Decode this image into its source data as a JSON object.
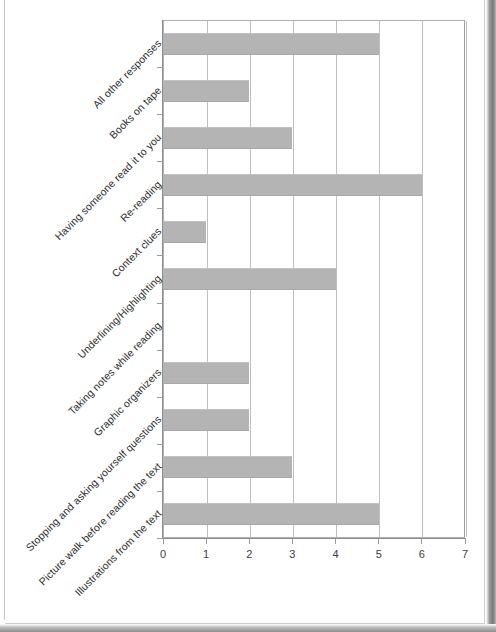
{
  "chart_data": {
    "type": "bar",
    "orientation": "horizontal",
    "title": "",
    "subtitle": "",
    "xlabel": "",
    "ylabel": "",
    "xlim": [
      0,
      7
    ],
    "ylim": null,
    "grid": true,
    "legend": null,
    "legend_position": "none",
    "xticks": [
      "0",
      "1",
      "2",
      "3",
      "4",
      "5",
      "6",
      "7"
    ],
    "categories": [
      "All other responses",
      "Books on tape",
      "Having someone read it to you",
      "Re-reading",
      "Context clues",
      "Underlining/Highlighting",
      "Taking notes while reading",
      "Graphic organizers",
      "Stopping and asking yourself questions",
      "Picture walk before reading the text",
      "Illustrations from the text"
    ],
    "values": [
      5,
      2,
      3,
      6,
      1,
      4,
      0,
      2,
      2,
      3,
      5
    ],
    "annotations": []
  },
  "style": {
    "bar_color": "#b4b4b4",
    "grid_color": "#bfbfbf",
    "axis_color": "#8d8d8d",
    "plot_background": "#ffffff",
    "page_background": "#ffffff",
    "tick_label_color": "#3d3d3d",
    "category_label_color": "#2e2e2e"
  }
}
